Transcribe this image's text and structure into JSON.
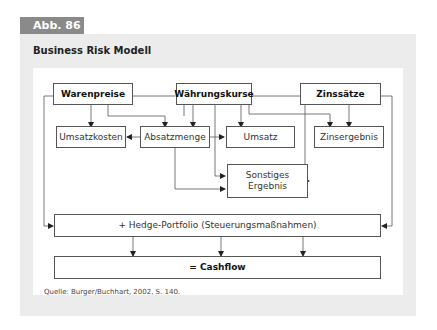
{
  "figure_label": "Abb. 86",
  "title": "Business Risk Modell",
  "nodes": {
    "warenpreise": "Warenpreise",
    "waehrungskurse": "Währungskurse",
    "zinssaetze": "Zinssätze",
    "umsatzkosten": "Umsatzkosten",
    "absatzmenge": "Absatzmenge",
    "umsatz": "Umsatz",
    "zinsergebnis": "Zinsergebnis",
    "sonstiges_ergebnis": "Sonstiges Ergebnis",
    "hedge_portfolio": "+ Hedge-Portfolio (Steuerungsmaßnahmen)",
    "cashflow": "= Cashflow"
  },
  "edges": [
    [
      "Warenpreise",
      "Umsatzkosten"
    ],
    [
      "Warenpreise",
      "Absatzmenge"
    ],
    [
      "Warenpreise",
      "Hedge-Portfolio"
    ],
    [
      "Währungskurse",
      "Absatzmenge"
    ],
    [
      "Währungskurse",
      "Umsatz"
    ],
    [
      "Währungskurse",
      "Zinsergebnis"
    ],
    [
      "Währungskurse",
      "Sonstiges Ergebnis"
    ],
    [
      "Zinssätze",
      "Zinsergebnis"
    ],
    [
      "Zinssätze",
      "Sonstiges Ergebnis"
    ],
    [
      "Zinssätze",
      "Hedge-Portfolio"
    ],
    [
      "Absatzmenge",
      "Umsatzkosten"
    ],
    [
      "Absatzmenge",
      "Umsatz"
    ],
    [
      "Absatzmenge",
      "Sonstiges Ergebnis"
    ],
    [
      "Hedge-Portfolio",
      "Cashflow"
    ]
  ],
  "source": "Quelle: Burger/Buchhart, 2002, S. 140."
}
